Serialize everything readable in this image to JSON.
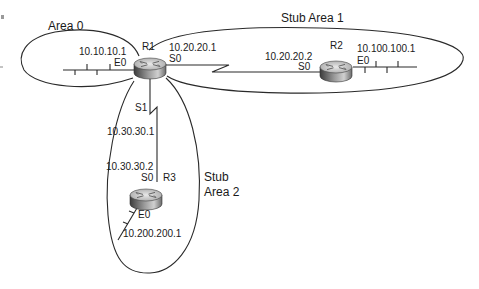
{
  "diagram": {
    "type": "ospf-network-topology",
    "areas": [
      {
        "id": "area0",
        "label": "Area 0"
      },
      {
        "id": "stub1",
        "label": "Stub Area 1"
      },
      {
        "id": "stub2",
        "label_line1": "Stub",
        "label_line2": "Area 2"
      }
    ],
    "routers": {
      "r1": {
        "name": "R1",
        "e0": {
          "iface": "E0",
          "ip": "10.10.10.1"
        },
        "s0": {
          "iface": "S0",
          "ip": "10.20.20.1"
        },
        "s1": {
          "iface": "S1",
          "ip": "10.30.30.1"
        }
      },
      "r2": {
        "name": "R2",
        "s0": {
          "iface": "S0",
          "ip": "10.20.20.2"
        },
        "e0": {
          "iface": "E0",
          "ip": "10.100.100.1"
        }
      },
      "r3": {
        "name": "R3",
        "s0": {
          "iface": "S0",
          "ip": "10.30.30.2"
        },
        "e0": {
          "iface": "E0",
          "ip": "10.200.200.1"
        }
      }
    },
    "links": [
      {
        "from": "R1 S0",
        "to": "R2 S0",
        "type": "serial"
      },
      {
        "from": "R1 S1",
        "to": "R3 S0",
        "type": "serial"
      }
    ],
    "colors": {
      "line": "#2a2a2a",
      "router_top": "#d8d8d8",
      "router_body_dark": "#555555",
      "background": "#ffffff"
    }
  }
}
